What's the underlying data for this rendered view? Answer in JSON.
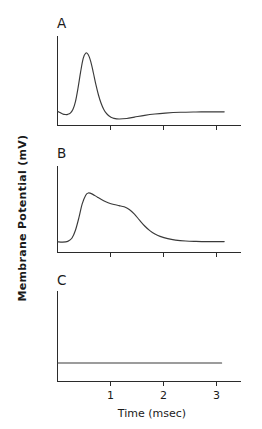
{
  "figure": {
    "background_color": "#ffffff",
    "trace_color": "#3a3a3a",
    "axis_color": "#2b2b2b",
    "y_axis_title": "Membrane Potential (mV)",
    "x_axis_title": "Time (msec)",
    "x_tick_labels": [
      "1",
      "2",
      "3"
    ],
    "panel_labels": [
      "A",
      "B",
      "C"
    ]
  },
  "chart_data": [
    {
      "type": "line",
      "panel": "A",
      "title": "A",
      "xlabel": "Time (msec)",
      "ylabel": "Membrane Potential (mV)",
      "xlim": [
        0,
        3.5
      ],
      "ylim": [
        -1,
        10
      ],
      "xticks": [
        1,
        2,
        3
      ],
      "xticklabels": [
        "1",
        "2",
        "3"
      ],
      "yticks": [],
      "grid": false,
      "legend": false,
      "description": "Fast action potential: sharp large spike peaking near 0.55 msec, rapid repolarization, brief undershoot then slow recovery toward baseline.",
      "series": [
        {
          "name": "trace-A",
          "x": [
            0.0,
            0.05,
            0.1,
            0.15,
            0.2,
            0.25,
            0.3,
            0.35,
            0.4,
            0.45,
            0.5,
            0.55,
            0.6,
            0.65,
            0.7,
            0.75,
            0.8,
            0.85,
            0.9,
            0.95,
            1.0,
            1.05,
            1.1,
            1.2,
            1.35,
            1.5,
            1.7,
            1.9,
            2.1,
            2.4,
            2.7,
            3.0,
            3.25
          ],
          "y": [
            0.8,
            0.62,
            0.45,
            0.38,
            0.4,
            0.55,
            1.0,
            2.0,
            3.7,
            5.7,
            7.4,
            8.1,
            7.9,
            7.0,
            5.6,
            4.1,
            2.8,
            1.8,
            1.05,
            0.55,
            0.22,
            0.02,
            -0.1,
            -0.18,
            -0.12,
            0.05,
            0.28,
            0.45,
            0.56,
            0.66,
            0.7,
            0.72,
            0.72
          ]
        }
      ]
    },
    {
      "type": "line",
      "panel": "B",
      "title": "B",
      "xlabel": "Time (msec)",
      "ylabel": "Membrane Potential (mV)",
      "xlim": [
        0,
        3.5
      ],
      "ylim": [
        -1,
        10
      ],
      "xticks": [
        1,
        2,
        3
      ],
      "xticklabels": [
        "1",
        "2",
        "3"
      ],
      "yticks": [],
      "grid": false,
      "legend": false,
      "description": "Broad depolarization: rapid rise to peak near 0.60 msec, then a slow decline with a pronounced plateau/shoulder around 1.2-1.5 msec before decaying to baseline.",
      "series": [
        {
          "name": "trace-B",
          "x": [
            0.0,
            0.1,
            0.2,
            0.28,
            0.35,
            0.42,
            0.48,
            0.55,
            0.6,
            0.68,
            0.78,
            0.9,
            1.0,
            1.1,
            1.2,
            1.3,
            1.4,
            1.5,
            1.6,
            1.7,
            1.8,
            1.9,
            2.0,
            2.15,
            2.3,
            2.5,
            2.7,
            2.9,
            3.1,
            3.25
          ],
          "y": [
            0.4,
            0.35,
            0.45,
            0.85,
            1.9,
            3.6,
            5.3,
            6.45,
            6.75,
            6.6,
            6.2,
            5.75,
            5.45,
            5.25,
            5.1,
            4.95,
            4.6,
            4.0,
            3.2,
            2.45,
            1.85,
            1.4,
            1.1,
            0.8,
            0.62,
            0.5,
            0.45,
            0.42,
            0.42,
            0.42
          ]
        }
      ]
    },
    {
      "type": "line",
      "panel": "C",
      "title": "C",
      "xlabel": "Time (msec)",
      "ylabel": "Membrane Potential (mV)",
      "xlim": [
        0,
        3.5
      ],
      "ylim": [
        -1,
        10
      ],
      "xticks": [
        1,
        2,
        3
      ],
      "xticklabels": [
        "1",
        "2",
        "3"
      ],
      "yticks": [],
      "grid": false,
      "legend": false,
      "description": "No response: membrane potential remains flat at resting baseline for the entire recording.",
      "series": [
        {
          "name": "trace-C",
          "x": [
            0.0,
            0.5,
            1.0,
            1.5,
            2.0,
            2.5,
            3.0,
            3.2
          ],
          "y": [
            1.3,
            1.3,
            1.3,
            1.3,
            1.3,
            1.3,
            1.3,
            1.3
          ]
        }
      ]
    }
  ]
}
